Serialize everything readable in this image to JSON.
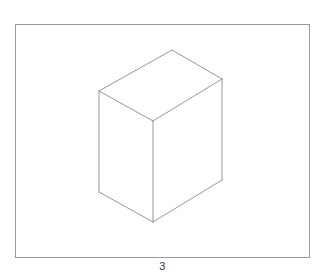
{
  "figure": {
    "caption": "3",
    "background_color": "#ffffff",
    "canvas": {
      "width": 325,
      "height": 280
    },
    "frame": {
      "label": "figure-border",
      "x": 15.5,
      "y": 24.5,
      "width": 294,
      "height": 233,
      "stroke_color": "#9a9a9a",
      "stroke_width": 1,
      "fill_color": "#ffffff"
    },
    "shape": {
      "name": "rectangular-box",
      "description": "Line drawing of a rectangular cuboid in isometric-style projection, three faces visible: top, front-left, front-right",
      "stroke_color": "#8c8c8c",
      "stroke_width": 0.9,
      "fill_color": "#ffffff",
      "vertices": {
        "top_back": [
          172,
          50
        ],
        "top_left": [
          99,
          91
        ],
        "top_right": [
          222,
          79
        ],
        "top_front": [
          153,
          121
        ],
        "bottom_left": [
          99,
          192
        ],
        "bottom_front": [
          153,
          222
        ],
        "bottom_right": [
          222,
          180
        ]
      },
      "faces": [
        {
          "name": "top-face",
          "points": "172,50 222,79 153,121 99,91"
        },
        {
          "name": "left-face",
          "points": "99,91 153,121 153,222 99,192"
        },
        {
          "name": "right-face",
          "points": "153,121 222,79 222,180 153,222"
        }
      ],
      "edges": [
        {
          "name": "edge-top-back-to-top-right",
          "d": "M 172,50 L 222,79"
        },
        {
          "name": "edge-top-right-to-top-front",
          "d": "M 222,79 L 153,121"
        },
        {
          "name": "edge-top-front-to-top-left",
          "d": "M 153,121 L 99,91"
        },
        {
          "name": "edge-top-left-to-top-back",
          "d": "M 99,91 L 172,50"
        },
        {
          "name": "edge-vertical-left",
          "d": "M 99,91 L 99,192"
        },
        {
          "name": "edge-vertical-front",
          "d": "M 153,121 L 153,222"
        },
        {
          "name": "edge-vertical-right",
          "d": "M 222,79 L 222,180"
        },
        {
          "name": "edge-bottom-left-to-bottom-front",
          "d": "M 99,192 L 153,222"
        },
        {
          "name": "edge-bottom-front-to-bottom-right",
          "d": "M 153,222 L 222,180"
        }
      ]
    }
  }
}
